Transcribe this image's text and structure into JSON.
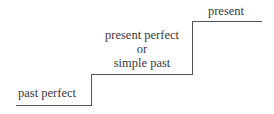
{
  "diagram": {
    "steps": [
      {
        "label": "past perfect"
      },
      {
        "label_lines": [
          "present perfect",
          "or",
          "simple past"
        ]
      },
      {
        "label": "present"
      }
    ]
  }
}
